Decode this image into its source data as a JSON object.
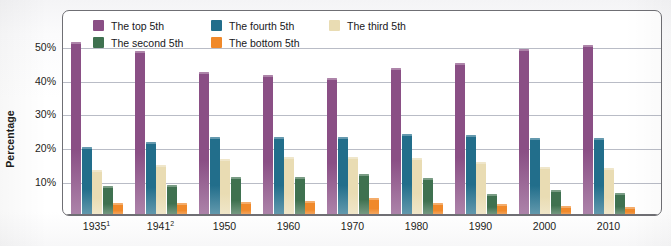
{
  "chart_data": {
    "type": "bar",
    "title": "",
    "subtitle": "",
    "xlabel": "",
    "ylabel": "Percentage",
    "categories": [
      "1935",
      "1941",
      "1950",
      "1960",
      "1970",
      "1980",
      "1990",
      "2000",
      "2010"
    ],
    "category_superscripts": [
      "1",
      "2",
      "",
      "",
      "",
      "",
      "",
      "",
      ""
    ],
    "ylim": [
      0,
      55
    ],
    "yticks": [
      10,
      20,
      30,
      40,
      50
    ],
    "ytick_labels": [
      "10%",
      "20%",
      "30%",
      "40%",
      "50%"
    ],
    "grid": true,
    "grid_axis": "y",
    "legend_position": "top-inside",
    "series": [
      {
        "name": "The top 5th",
        "color": "#8A4F85",
        "values": [
          51.7,
          49.0,
          42.7,
          41.9,
          40.9,
          44.0,
          45.3,
          49.5,
          50.8
        ]
      },
      {
        "name": "The fourth 5th",
        "color": "#226E8B",
        "values": [
          20.4,
          21.8,
          23.2,
          23.3,
          23.2,
          24.3,
          23.8,
          23.0,
          23.0
        ]
      },
      {
        "name": "The third 5th",
        "color": "#E9DCB3",
        "values": [
          13.4,
          14.8,
          16.8,
          17.2,
          17.3,
          17.0,
          15.9,
          14.3,
          14.0
        ]
      },
      {
        "name": "The second 5th",
        "color": "#3F7150",
        "values": [
          8.7,
          9.1,
          11.3,
          11.5,
          12.2,
          11.0,
          6.2,
          7.4,
          6.5
        ]
      },
      {
        "name": "The bottom 5th",
        "color": "#F0892A",
        "values": [
          3.5,
          3.5,
          4.0,
          4.2,
          5.0,
          3.5,
          3.4,
          2.7,
          2.3
        ]
      }
    ],
    "legend_order": [
      "The top 5th",
      "The fourth 5th",
      "The third 5th",
      "The second 5th",
      "The bottom 5th"
    ]
  },
  "colors": {
    "top_5th": "#8A4F85",
    "fourth_5th": "#226E8B",
    "third_5th": "#E9DCB3",
    "second_5th": "#3F7150",
    "bottom_5th": "#F0892A",
    "gridline": "#b9bcc6",
    "frame": "#6f6f74",
    "text": "#1d1d20"
  }
}
